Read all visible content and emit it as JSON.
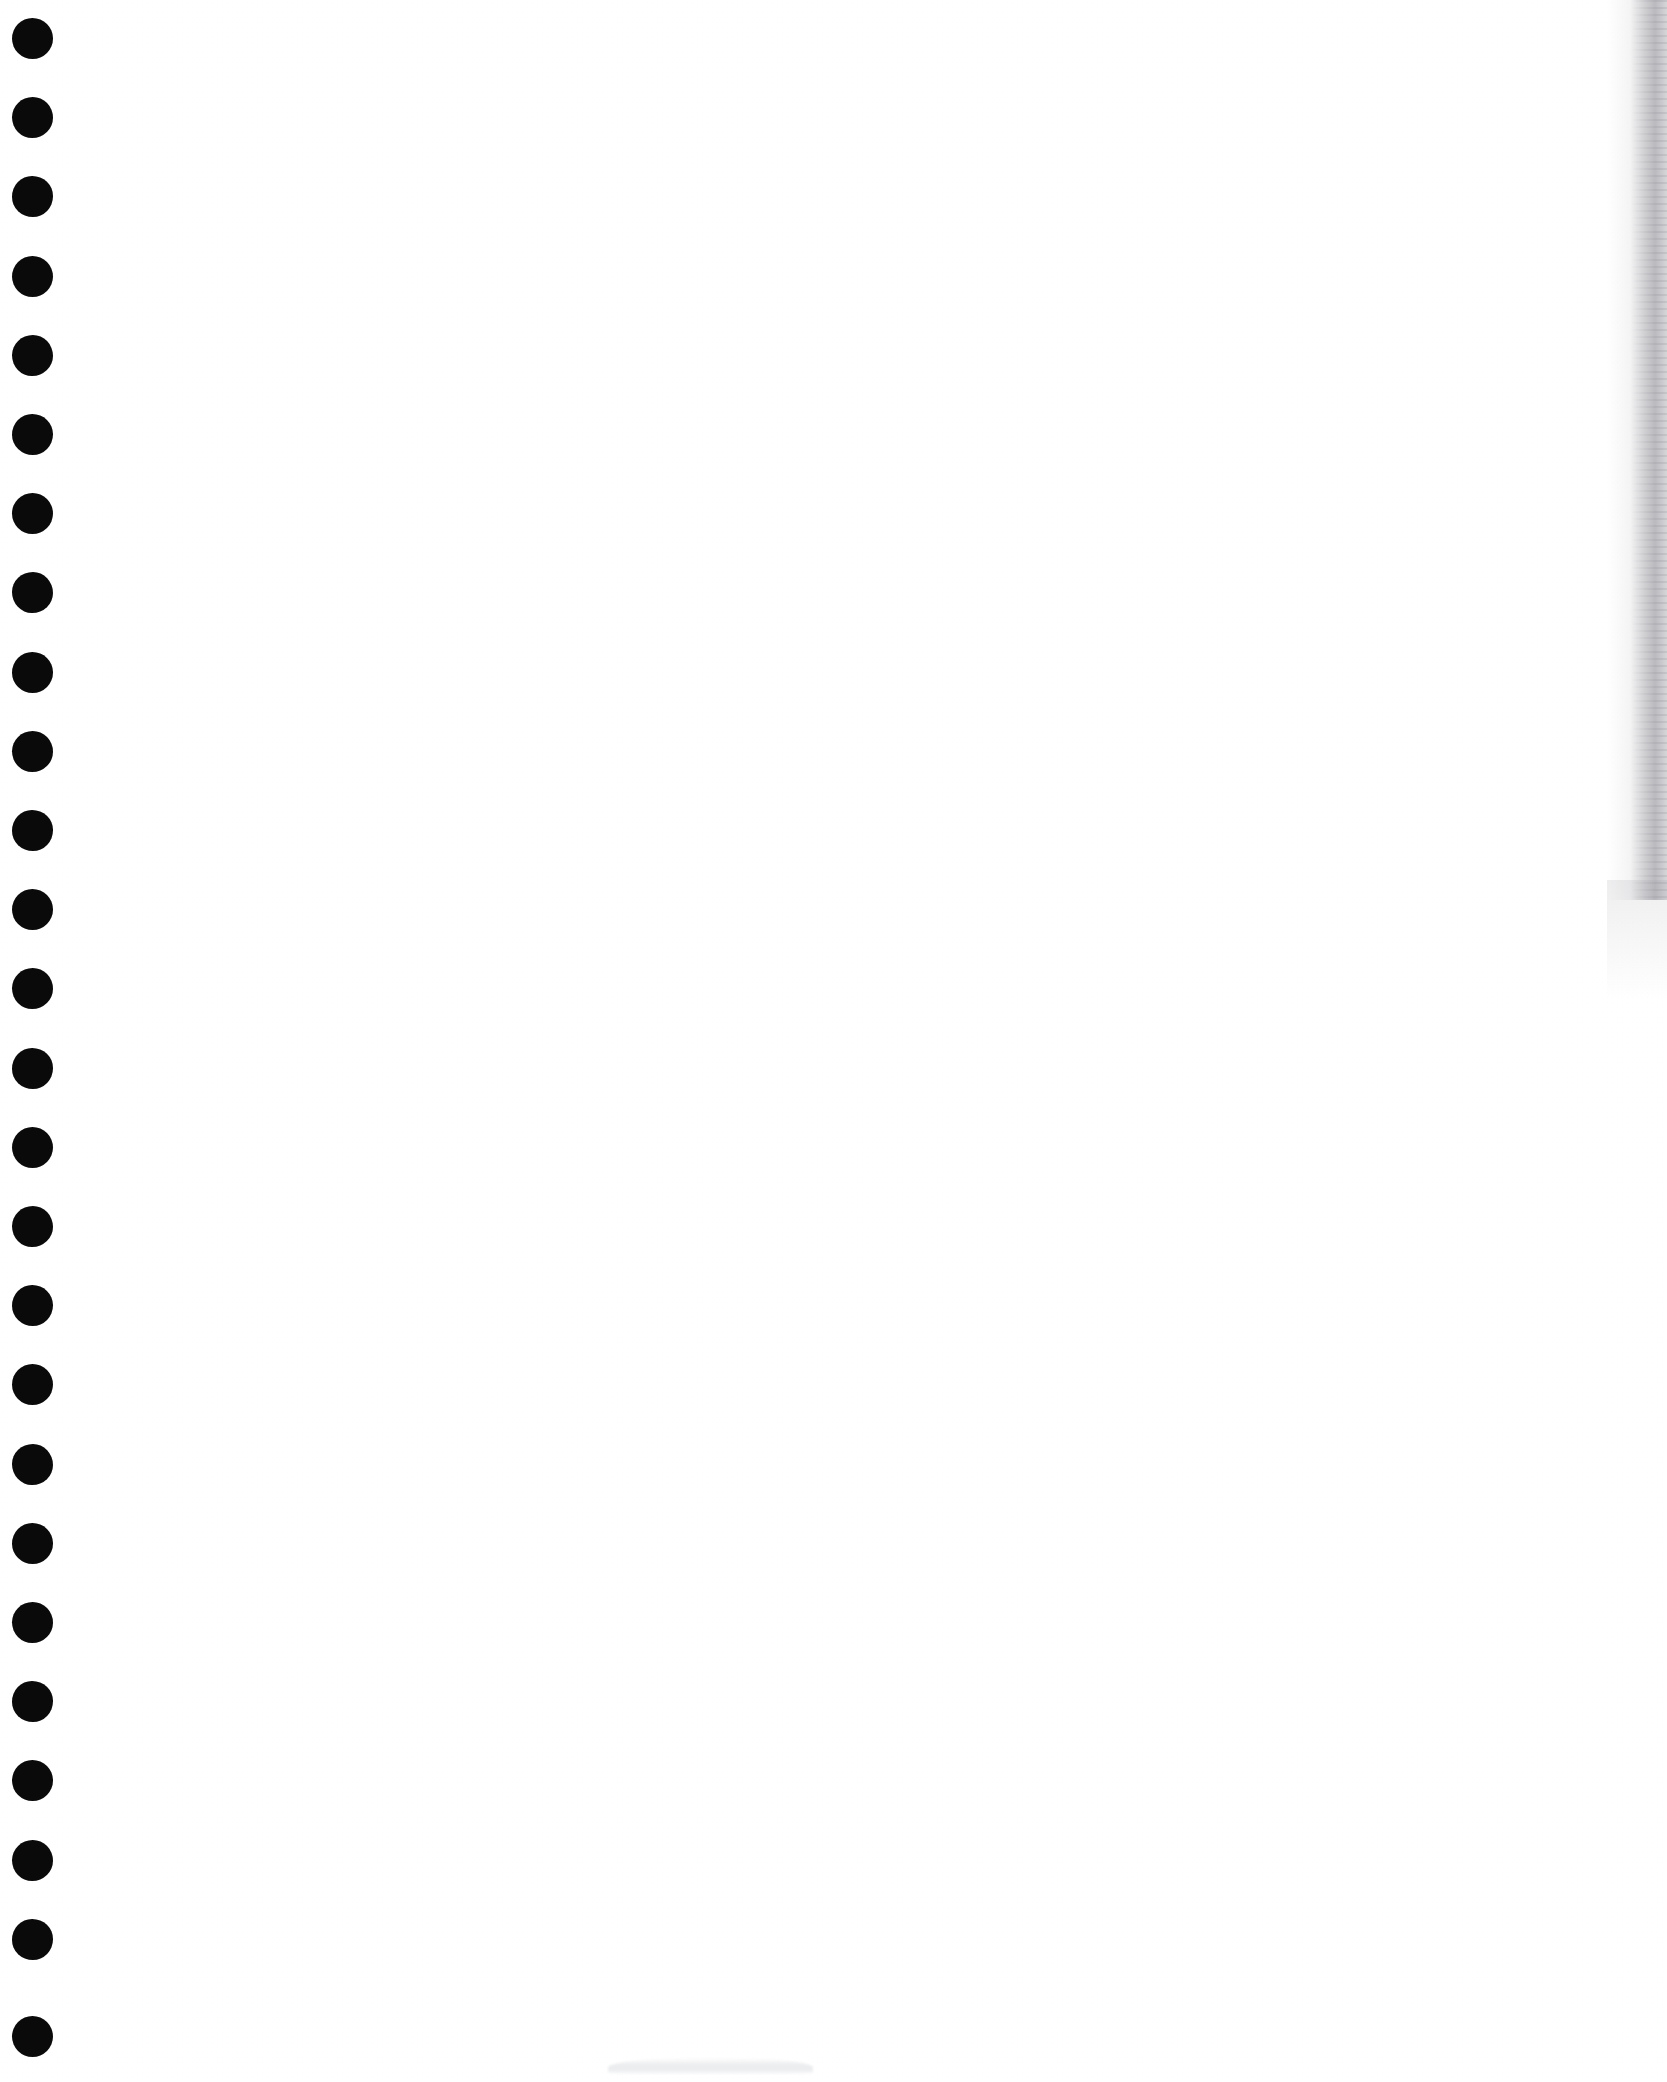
{
  "document": {
    "kind": "scanned-page",
    "title": "Scanned Blank Page",
    "page_width": 1667,
    "page_height": 2082,
    "background_color": "#ffffff",
    "visible_text": "",
    "body_text": "",
    "notes_text": ""
  },
  "binding": {
    "label": "Punched binder holes",
    "hole_color": "#0a0a0a",
    "hole_count": 26,
    "hole_diameter": 41,
    "hole_center_x": 32,
    "first_hole_center_y": 38,
    "hole_spacing_y": 79.2,
    "holes": [
      {
        "index": 1,
        "cy": 38
      },
      {
        "index": 2,
        "cy": 117
      },
      {
        "index": 3,
        "cy": 196
      },
      {
        "index": 4,
        "cy": 276
      },
      {
        "index": 5,
        "cy": 355
      },
      {
        "index": 6,
        "cy": 434
      },
      {
        "index": 7,
        "cy": 513
      },
      {
        "index": 8,
        "cy": 592
      },
      {
        "index": 9,
        "cy": 672
      },
      {
        "index": 10,
        "cy": 751
      },
      {
        "index": 11,
        "cy": 830
      },
      {
        "index": 12,
        "cy": 909
      },
      {
        "index": 13,
        "cy": 988
      },
      {
        "index": 14,
        "cy": 1068
      },
      {
        "index": 15,
        "cy": 1147
      },
      {
        "index": 16,
        "cy": 1226
      },
      {
        "index": 17,
        "cy": 1305
      },
      {
        "index": 18,
        "cy": 1384
      },
      {
        "index": 19,
        "cy": 1464
      },
      {
        "index": 20,
        "cy": 1543
      },
      {
        "index": 21,
        "cy": 1622
      },
      {
        "index": 22,
        "cy": 1701
      },
      {
        "index": 23,
        "cy": 1780
      },
      {
        "index": 24,
        "cy": 1860
      },
      {
        "index": 25,
        "cy": 1939
      },
      {
        "index": 26,
        "cy": 2036
      }
    ]
  },
  "artifacts": {
    "right_edge_streak": {
      "label": "Scanner edge shadow",
      "color": "#6e6e78",
      "x": 1607,
      "y": 0,
      "width": 60,
      "height": 900
    },
    "bottom_smudge": {
      "label": "Faint gray smudge",
      "color": "#dfe1e4",
      "x": 608,
      "y": 2058,
      "width": 205,
      "height": 16
    }
  }
}
